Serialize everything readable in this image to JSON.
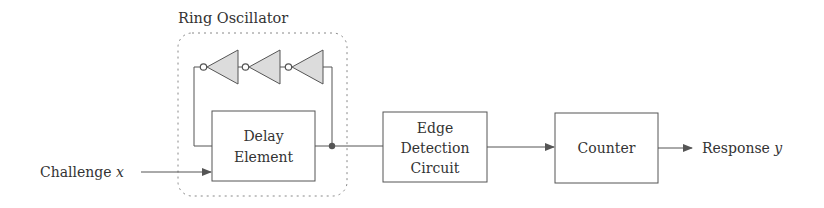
{
  "diagram": {
    "title": "Ring Oscillator",
    "colors": {
      "stroke": "#555555",
      "text": "#333333",
      "inverter_fill": "#dcdcdc",
      "dashed_box": "#888888",
      "background": "#ffffff"
    },
    "input": {
      "label": "Challenge",
      "variable": "x"
    },
    "output": {
      "label": "Response",
      "variable": "y"
    },
    "blocks": {
      "delay_element": {
        "line1": "Delay",
        "line2": "Element"
      },
      "edge_detection": {
        "line1": "Edge",
        "line2": "Detection",
        "line3": "Circuit"
      },
      "counter": {
        "line1": "Counter"
      }
    },
    "inverters": [
      {
        "name": "inverter-1"
      },
      {
        "name": "inverter-2"
      },
      {
        "name": "inverter-3"
      }
    ],
    "connections": [
      "Challenge x -> Delay Element",
      "Delay Element -> Edge Detection Circuit",
      "Edge Detection Circuit -> Counter",
      "Counter -> Response y",
      "Delay Element output -> Inverter chain -> Delay Element feedback input"
    ]
  }
}
